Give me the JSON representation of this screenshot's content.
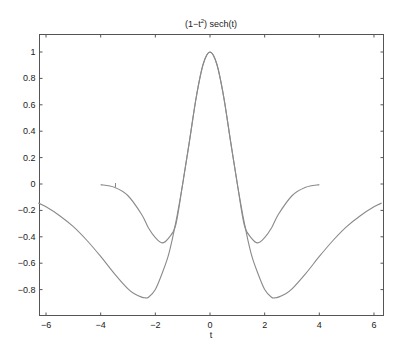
{
  "chart_data": {
    "type": "line",
    "title_main": "(1−t",
    "title_sup": "2",
    "title_rest": ") sech(t)",
    "xlabel": "t",
    "ylabel": "",
    "xlim": [
      -6.2832,
      6.2832
    ],
    "ylim": [
      -1.0,
      1.14
    ],
    "grid": false,
    "legend": null,
    "xticks": [
      -6,
      -4,
      -2,
      0,
      2,
      4,
      6
    ],
    "xtick_labels": [
      "−6",
      "−4",
      "−2",
      "0",
      "2",
      "4",
      "6"
    ],
    "yticks": [
      -0.8,
      -0.6,
      -0.4,
      -0.2,
      0,
      0.2,
      0.4,
      0.6,
      0.8,
      1
    ],
    "ytick_labels": [
      "−0.8",
      "−0.6",
      "−0.4",
      "−0.2",
      "0",
      "0.2",
      "0.4",
      "0.6",
      "0.8",
      "1"
    ],
    "line_color": "#8a8a8a",
    "series": [
      {
        "name": "(1-t^2) sech(t)",
        "x": [
          -6.2832,
          -6,
          -5.5,
          -5,
          -4.5,
          -4,
          -3.5,
          -3,
          -2.75,
          -2.5,
          -2.4,
          -2.25,
          -2,
          -1.75,
          -1.5,
          -1.25,
          -1,
          -0.75,
          -0.5,
          -0.25,
          0,
          0.25,
          0.5,
          0.75,
          1,
          1.25,
          1.5,
          1.75,
          2,
          2.25,
          2.4,
          2.5,
          2.75,
          3,
          3.5,
          4,
          4.5,
          5,
          5.5,
          6,
          6.2832
        ],
        "values": [
          -0.144,
          -0.173,
          -0.24,
          -0.323,
          -0.428,
          -0.549,
          -0.679,
          -0.795,
          -0.833,
          -0.857,
          -0.862,
          -0.858,
          -0.799,
          -0.676,
          -0.523,
          -0.289,
          0.0,
          0.327,
          0.661,
          0.907,
          1.0,
          0.907,
          0.661,
          0.327,
          0.0,
          -0.289,
          -0.523,
          -0.676,
          -0.799,
          -0.858,
          -0.862,
          -0.857,
          -0.833,
          -0.795,
          -0.679,
          -0.549,
          -0.428,
          -0.323,
          -0.24,
          -0.173,
          -0.144
        ]
      },
      {
        "name": "(1-t^2) exp(-t^2/2)",
        "x": [
          -4,
          -3.5,
          -3,
          -2.5,
          -2.25,
          -2,
          -1.75,
          -1.5,
          -1.25,
          -1,
          -0.75,
          -0.5,
          -0.25,
          0,
          0.25,
          0.5,
          0.75,
          1,
          1.25,
          1.5,
          1.75,
          2,
          2.25,
          2.5,
          3,
          3.5,
          4
        ],
        "values": [
          -0.005,
          -0.025,
          -0.089,
          -0.231,
          -0.334,
          -0.406,
          -0.446,
          -0.406,
          -0.307,
          0.0,
          0.326,
          0.662,
          0.908,
          1.0,
          0.908,
          0.662,
          0.326,
          0.0,
          -0.307,
          -0.406,
          -0.446,
          -0.406,
          -0.334,
          -0.231,
          -0.089,
          -0.025,
          -0.005
        ]
      }
    ]
  }
}
